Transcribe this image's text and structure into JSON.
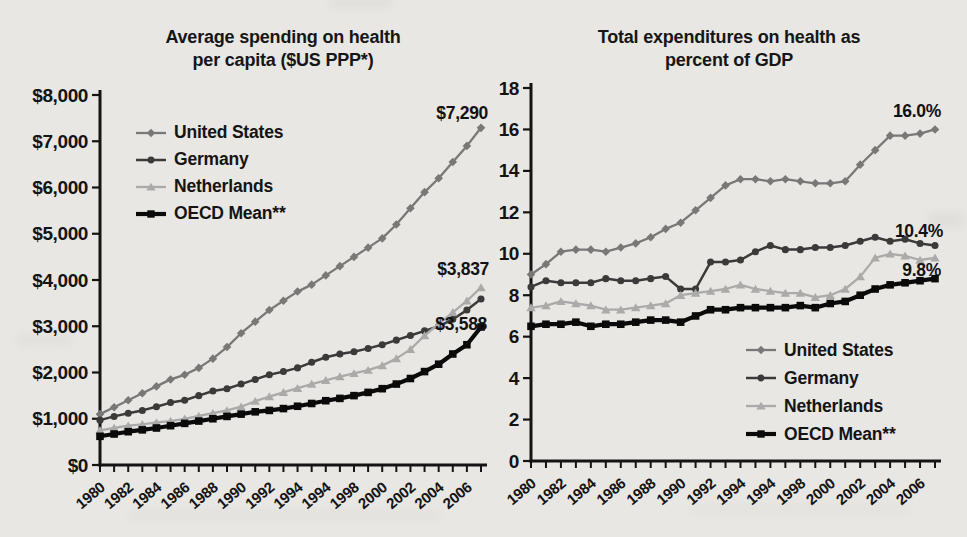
{
  "page": {
    "background": "#e9e7e3"
  },
  "chart_data": [
    {
      "type": "line",
      "title": "Average spending on health per capita ($US PPP*)",
      "x_years": [
        1980,
        1981,
        1982,
        1983,
        1984,
        1985,
        1986,
        1987,
        1988,
        1989,
        1990,
        1991,
        1992,
        1993,
        1994,
        1995,
        1996,
        1997,
        1998,
        1999,
        2000,
        2001,
        2002,
        2003,
        2004,
        2005,
        2006,
        2007
      ],
      "xtick_labels": [
        "1980",
        "1982",
        "1984",
        "1986",
        "1988",
        "1990",
        "1992",
        "1994",
        "1994",
        "1998",
        "2000",
        "2002",
        "2004",
        "2006"
      ],
      "ylim": [
        0,
        8000
      ],
      "ytick_values": [
        0,
        1000,
        2000,
        3000,
        4000,
        5000,
        6000,
        7000,
        8000
      ],
      "ytick_labels": [
        "$0",
        "$1,000",
        "$2,000",
        "$3,000",
        "$4,000",
        "$5,000",
        "$6,000",
        "$7,000",
        "$8,000"
      ],
      "grid": false,
      "legend_position": "upper-left",
      "series": [
        {
          "name": "United States",
          "color": "#787878",
          "marker": "diamond",
          "line_width": 2.3,
          "values": [
            1100,
            1250,
            1400,
            1550,
            1700,
            1850,
            1950,
            2100,
            2300,
            2550,
            2850,
            3100,
            3350,
            3550,
            3750,
            3900,
            4100,
            4300,
            4500,
            4700,
            4900,
            5200,
            5550,
            5900,
            6200,
            6550,
            6900,
            7290
          ]
        },
        {
          "name": "Germany",
          "color": "#3a3a3a",
          "marker": "circle",
          "line_width": 2.5,
          "values": [
            970,
            1050,
            1120,
            1180,
            1260,
            1350,
            1400,
            1500,
            1600,
            1650,
            1750,
            1850,
            1950,
            2020,
            2100,
            2220,
            2330,
            2400,
            2450,
            2520,
            2600,
            2700,
            2800,
            2900,
            3000,
            3150,
            3350,
            3588
          ]
        },
        {
          "name": "Netherlands",
          "color": "#aaaaaa",
          "marker": "triangle",
          "line_width": 2.3,
          "values": [
            750,
            800,
            850,
            880,
            920,
            950,
            1000,
            1060,
            1120,
            1180,
            1260,
            1380,
            1480,
            1570,
            1660,
            1750,
            1830,
            1910,
            1980,
            2050,
            2150,
            2300,
            2500,
            2800,
            3050,
            3300,
            3550,
            3837
          ]
        },
        {
          "name": "OECD Mean**",
          "color": "#0a0a0a",
          "marker": "square",
          "line_width": 4.2,
          "values": [
            620,
            670,
            720,
            760,
            800,
            850,
            900,
            950,
            1000,
            1050,
            1100,
            1150,
            1180,
            1220,
            1270,
            1330,
            1390,
            1440,
            1500,
            1570,
            1650,
            1750,
            1870,
            2020,
            2180,
            2400,
            2600,
            2984
          ]
        }
      ],
      "annotations": [
        {
          "text": "$7,290",
          "year": 2007,
          "value": 7290,
          "dx": 7,
          "dy": -9,
          "anchor": "end"
        },
        {
          "text": "$3,837",
          "year": 2007,
          "value": 3837,
          "dx": 8,
          "dy": -13,
          "anchor": "end"
        },
        {
          "text": "$3,588",
          "year": 2007,
          "value": 3588,
          "dx": 6,
          "dy": 31,
          "anchor": "end"
        }
      ]
    },
    {
      "type": "line",
      "title": "Total expenditures on health as percent of GDP",
      "x_years": [
        1980,
        1981,
        1982,
        1983,
        1984,
        1985,
        1986,
        1987,
        1988,
        1989,
        1990,
        1991,
        1992,
        1993,
        1994,
        1995,
        1996,
        1997,
        1998,
        1999,
        2000,
        2001,
        2002,
        2003,
        2004,
        2005,
        2006,
        2007
      ],
      "xtick_labels": [
        "1980",
        "1982",
        "1984",
        "1986",
        "1988",
        "1990",
        "1992",
        "1994",
        "1994",
        "1998",
        "2000",
        "2002",
        "2004",
        "2006"
      ],
      "ylim": [
        0,
        18
      ],
      "ytick_values": [
        0,
        2,
        4,
        6,
        8,
        10,
        12,
        14,
        16,
        18
      ],
      "ytick_labels": [
        "0",
        "2",
        "4",
        "6",
        "8",
        "10",
        "12",
        "14",
        "16",
        "18"
      ],
      "grid": false,
      "legend_position": "lower-right",
      "series": [
        {
          "name": "United States",
          "color": "#787878",
          "marker": "diamond",
          "line_width": 2.3,
          "values": [
            9.0,
            9.5,
            10.1,
            10.2,
            10.2,
            10.1,
            10.3,
            10.5,
            10.8,
            11.2,
            11.5,
            12.1,
            12.7,
            13.3,
            13.6,
            13.6,
            13.5,
            13.6,
            13.5,
            13.4,
            13.4,
            13.5,
            14.3,
            15.0,
            15.7,
            15.7,
            15.8,
            16.0
          ]
        },
        {
          "name": "Germany",
          "color": "#3a3a3a",
          "marker": "circle",
          "line_width": 2.5,
          "values": [
            8.4,
            8.7,
            8.6,
            8.6,
            8.6,
            8.8,
            8.7,
            8.7,
            8.8,
            8.9,
            8.3,
            8.3,
            9.6,
            9.6,
            9.7,
            10.1,
            10.4,
            10.2,
            10.2,
            10.3,
            10.3,
            10.4,
            10.6,
            10.8,
            10.6,
            10.7,
            10.5,
            10.4
          ]
        },
        {
          "name": "Netherlands",
          "color": "#aaaaaa",
          "marker": "triangle",
          "line_width": 2.3,
          "values": [
            7.4,
            7.5,
            7.7,
            7.6,
            7.5,
            7.3,
            7.3,
            7.4,
            7.5,
            7.6,
            8.0,
            8.1,
            8.2,
            8.3,
            8.5,
            8.3,
            8.2,
            8.1,
            8.1,
            7.9,
            8.0,
            8.3,
            8.9,
            9.8,
            10.0,
            9.9,
            9.7,
            9.8
          ]
        },
        {
          "name": "OECD Mean**",
          "color": "#0a0a0a",
          "marker": "square",
          "line_width": 4.2,
          "values": [
            6.5,
            6.6,
            6.6,
            6.7,
            6.5,
            6.6,
            6.6,
            6.7,
            6.8,
            6.8,
            6.7,
            7.0,
            7.3,
            7.3,
            7.4,
            7.4,
            7.4,
            7.4,
            7.5,
            7.4,
            7.6,
            7.7,
            8.0,
            8.3,
            8.5,
            8.6,
            8.7,
            8.8
          ]
        }
      ],
      "annotations": [
        {
          "text": "16.0%",
          "year": 2007,
          "value": 16.0,
          "dx": 6,
          "dy": -12,
          "anchor": "end"
        },
        {
          "text": "10.4%",
          "year": 2007,
          "value": 10.4,
          "dx": 8,
          "dy": -8,
          "anchor": "end"
        },
        {
          "text": "9.8%",
          "year": 2007,
          "value": 9.8,
          "dx": 6,
          "dy": 18,
          "anchor": "end"
        }
      ]
    }
  ]
}
